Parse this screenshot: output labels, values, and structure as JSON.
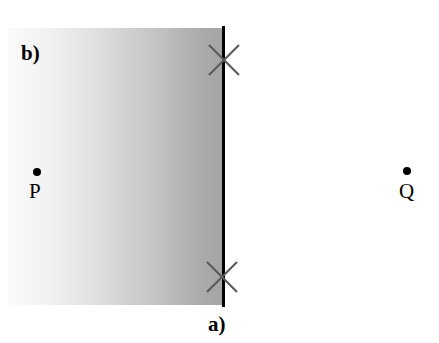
{
  "figure": {
    "background_color": "#ffffff",
    "width": 439,
    "height": 343
  },
  "regions": {
    "shaded": {
      "name": "medium-b",
      "gradient_from": "#fbfbfb",
      "gradient_to": "#a6a6a6",
      "gradient_direction": "left-to-right"
    },
    "clear": {
      "name": "medium-a",
      "color": "#ffffff"
    }
  },
  "interface": {
    "color": "#000000",
    "orientation": "vertical"
  },
  "marks": {
    "cross_color": "#555555",
    "top_label": "x-mark-top",
    "bottom_label": "x-mark-bottom"
  },
  "points": [
    {
      "id": "p",
      "label": "P",
      "dot_color": "#000000"
    },
    {
      "id": "q",
      "label": "Q",
      "dot_color": "#000000"
    }
  ],
  "annotations": {
    "region_a": "a)",
    "region_b": "b)"
  }
}
